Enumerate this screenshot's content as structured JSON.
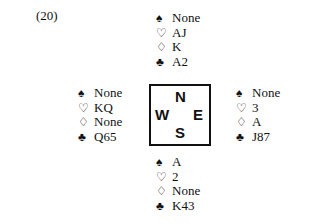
{
  "problem_label": "(20)",
  "suit_symbols": {
    "spades": "♠",
    "hearts": "♡",
    "diamonds": "♢",
    "clubs": "♣"
  },
  "hands": {
    "north": {
      "spades": "None",
      "hearts": "AJ",
      "diamonds": "K",
      "clubs": "A2"
    },
    "west": {
      "spades": "None",
      "hearts": "KQ",
      "diamonds": "None",
      "clubs": "Q65"
    },
    "east": {
      "spades": "None",
      "hearts": "3",
      "diamonds": "A",
      "clubs": "J87"
    },
    "south": {
      "spades": "A",
      "hearts": "2",
      "diamonds": "None",
      "clubs": "K43"
    }
  },
  "compass": {
    "n": "N",
    "w": "W",
    "e": "E",
    "s": "S"
  }
}
